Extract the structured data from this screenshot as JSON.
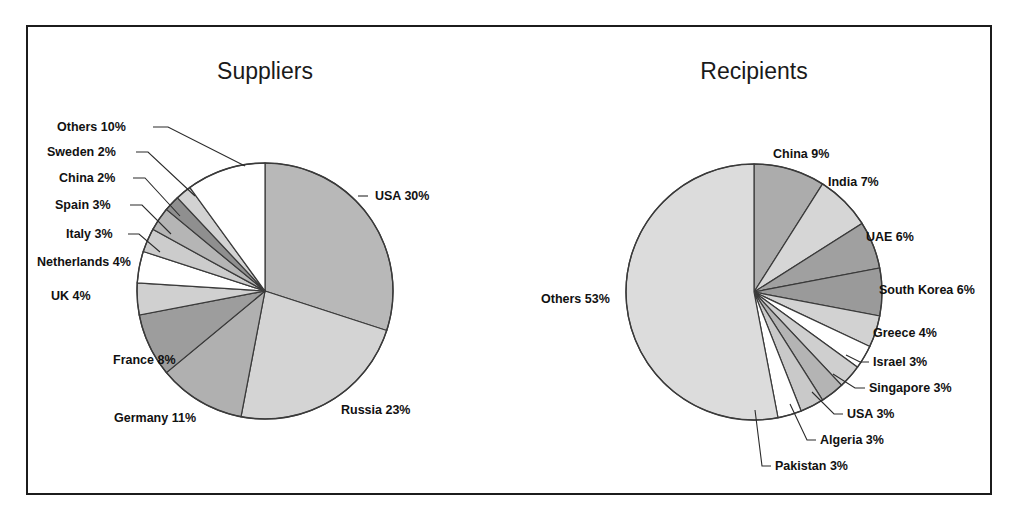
{
  "figure": {
    "background": "#ffffff",
    "frame_color": "#1c1c1c"
  },
  "chart_data": [
    {
      "type": "pie",
      "title": "Suppliers",
      "center": [
        265,
        291
      ],
      "radius": 128,
      "start_angle": 0,
      "direction": "clockwise",
      "categories": [
        "USA",
        "Russia",
        "Germany",
        "France",
        "UK",
        "Netherlands",
        "Italy",
        "Spain",
        "China",
        "Sweden",
        "Others"
      ],
      "values": [
        30,
        23,
        11,
        8,
        4,
        4,
        3,
        3,
        2,
        2,
        10
      ],
      "labels": [
        "USA 30%",
        "Russia 23%",
        "Germany 11%",
        "France 8%",
        "UK 4%",
        "Netherlands 4%",
        "Italy 3%",
        "Spain 3%",
        "China 2%",
        "Sweden 2%",
        "Others 10%"
      ],
      "colors": [
        "#b8b8b8",
        "#d4d4d4",
        "#b0b0b0",
        "#9d9d9d",
        "#d0d0d0",
        "#ffffff",
        "#cccccc",
        "#b5b5b5",
        "#8f8f8f",
        "#d2d2d2",
        "#ffffff"
      ],
      "legend": "none",
      "grid": false
    },
    {
      "type": "pie",
      "title": "Recipients",
      "center": [
        754,
        292
      ],
      "radius": 128,
      "start_angle": 0,
      "direction": "clockwise",
      "categories": [
        "China",
        "India",
        "UAE",
        "South Korea",
        "Greece",
        "Israel",
        "Singapore",
        "USA",
        "Algeria",
        "Pakistan",
        "Others"
      ],
      "values": [
        9,
        7,
        6,
        6,
        4,
        3,
        3,
        3,
        3,
        3,
        53
      ],
      "labels": [
        "China 9%",
        "India 7%",
        "UAE 6%",
        "South Korea 6%",
        "Greece 4%",
        "Israel 3%",
        "Singapore 3%",
        "USA 3%",
        "Algeria 3%",
        "Pakistan 3%",
        "Others 53%"
      ],
      "colors": [
        "#acacac",
        "#d6d6d6",
        "#a0a0a0",
        "#9a9a9a",
        "#d2d2d2",
        "#ffffff",
        "#cfcfcf",
        "#b4b4b4",
        "#c9c9c9",
        "#ffffff",
        "#dcdcdc"
      ],
      "legend": "none",
      "grid": false
    }
  ]
}
